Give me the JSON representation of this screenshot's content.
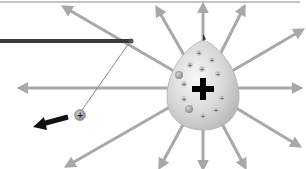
{
  "diagram": {
    "type": "electric-field",
    "colors": {
      "background": "#ffffff",
      "field_line": "#a8a8a8",
      "top_rule": "#c4c4c4",
      "rod": "#3a3a3a",
      "thread": "#8a8a8a",
      "source_body": "#d9d9d9",
      "source_highlight": "#f4f4f4",
      "small_charge": "#8c8c8c",
      "force_arrow": "#111111",
      "plus_sign": "#000000"
    },
    "source_charge": {
      "label": "+",
      "center": [
        203,
        88
      ],
      "small_charges": [
        {
          "label": "+",
          "x": 199,
          "y": 53
        },
        {
          "label": "+",
          "x": 190,
          "y": 65
        },
        {
          "label": "+",
          "x": 212,
          "y": 60
        },
        {
          "label": "+",
          "x": 202,
          "y": 69
        },
        {
          "label": "+",
          "x": 184,
          "y": 80
        },
        {
          "label": "+",
          "x": 216,
          "y": 75
        },
        {
          "label": "+",
          "x": 222,
          "y": 98
        },
        {
          "label": "+",
          "x": 185,
          "y": 108
        },
        {
          "label": "+",
          "x": 218,
          "y": 111
        },
        {
          "label": "+",
          "x": 203,
          "y": 118
        },
        {
          "label": "+",
          "x": 190,
          "y": 92
        }
      ]
    },
    "test_charge": {
      "label": "+",
      "center": [
        80,
        115
      ]
    },
    "force_arrow": {
      "direction": "left-down",
      "from": [
        68,
        118
      ],
      "to": [
        34,
        127
      ]
    }
  }
}
